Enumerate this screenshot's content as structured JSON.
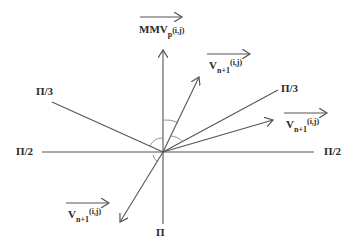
{
  "diagram": {
    "type": "vector angle diagram",
    "origin": [
      163,
      152
    ],
    "colors": {
      "line": "#555555",
      "text": "#2a2a2a",
      "background": "#ffffff"
    },
    "labels": {
      "mmv": {
        "main": "MMV",
        "sub": "p",
        "idx": "(i,j)"
      },
      "v_upper": {
        "main": "V",
        "sub": "n+1",
        "idx": "(i,j)"
      },
      "v_right": {
        "main": "V",
        "sub": "n+1",
        "idx": "(i,j)"
      },
      "v_lower": {
        "main": "V",
        "sub": "n+1",
        "idx": "(i,j)"
      },
      "pi3_left": "Π/3",
      "pi3_right": "Π/3",
      "pi2_left": "Π/2",
      "pi2_right": "Π/2",
      "pi_bottom": "Π"
    }
  }
}
